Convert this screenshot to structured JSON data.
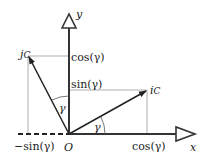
{
  "diagram": {
    "axes": {
      "x_label": "x",
      "y_label": "y",
      "origin_label": "O"
    },
    "vectors": [
      {
        "name": "i",
        "subscript": "C",
        "label": "i",
        "sub": "C"
      },
      {
        "name": "j",
        "subscript": "C",
        "label": "j",
        "sub": "C"
      }
    ],
    "labels": {
      "cos_y_axis": "cos(γ)",
      "sin_y_axis": "sin(γ)",
      "cos_x_axis": "cos(γ)",
      "neg_sin_x_axis": "−sin(γ)",
      "angle_i": "γ",
      "angle_j": "γ"
    },
    "colors": {
      "stroke": "#333333",
      "guide": "#999999",
      "background": "#ffffff"
    }
  }
}
